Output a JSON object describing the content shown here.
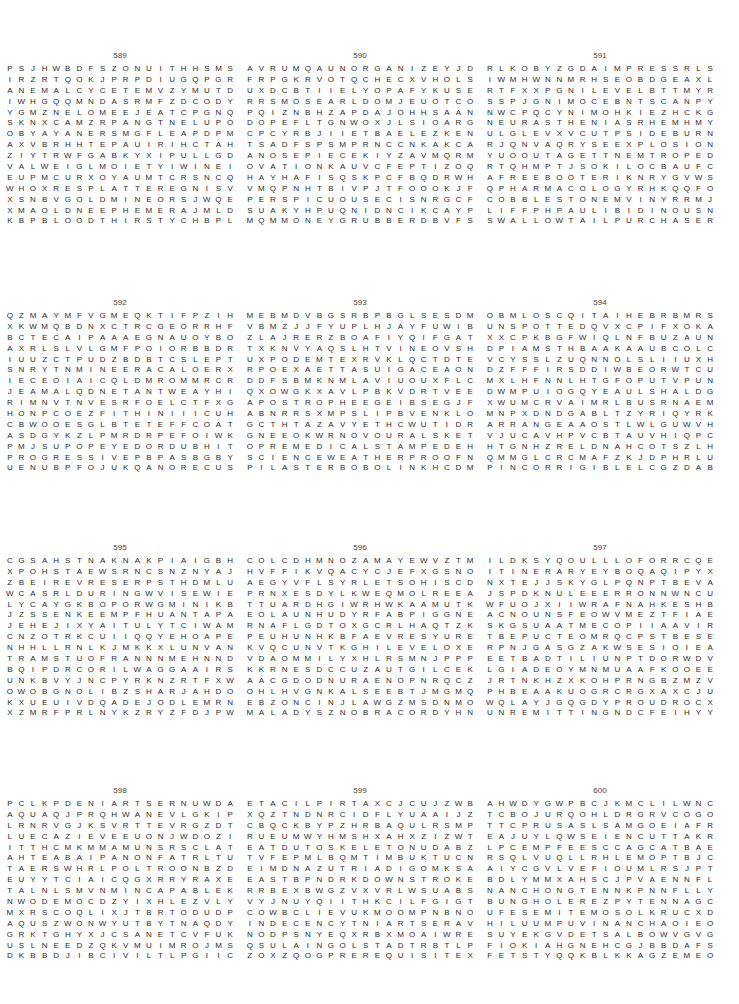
{
  "document": {
    "type": "word-search-solutions",
    "puzzles": [
      {
        "number": "589",
        "rows": [
          "PSJHWBDFSZONUITHHSMS",
          "IRZRTQOKJPRPDIUGQPGR",
          "ANEMALCYCETEMVZYMUTD",
          "IWHGQQMNDASRMFZDCODY",
          "YGMZNELOMEEJEATCPGNQ",
          "SKNXCAMZRPANGTNELUPO",
          "OBYAYANERSMGFLEAPDPM",
          "AXVBRHHTEPAUIRIHCTAH",
          "ZIYTRWFGABKYXIPULLGD",
          "VALWEIGLMOIETYIWINEI",
          "EUPMCURXOYAUMTCRSNCQ",
          "WHOXRESPLATTEREGNISV",
          "XSNBVGOLDMINEORSJWQE",
          "XMAOLDNEEPHEMERAJMLD",
          "KBPBLOODTHIRSTYCHBPL"
        ],
        "found_words": [
          "CYCLAMEN",
          "MOIETY",
          "SPLATTER",
          "SINGER",
          "GOLDMINE",
          "EPHEMERA",
          "BLOODTHIRSTY",
          "OPULENT",
          "PULLED",
          "EUPHONIUM"
        ]
      },
      {
        "number": "590",
        "rows": [
          "AVRUMQAUNORGANIZEYJD",
          "FRPGKRVOTQCHECXVHOLS",
          "UXDCBTIIELYOPAFYKUSE",
          "RRSMOSEARLDOMJEUOTCO",
          "PQIZNBHZAPDAJOHHSAAN",
          "DOPEFLTGNWOXJLSIOARG",
          "CPCYRBJIIETBAELEZKEN",
          "TSADFSPSMPRNCCNKAKCA",
          "ANOSEPIECEKIYZAVMQRM",
          "OVATIONKAUVCFEPTIZOQ",
          "HAYHAFISQSKPCFBQDRWH",
          "VMQPNHTBIVPJTFOOOKJF",
          "PERSPICUOUSECISNRGCF",
          "SUAKYHPUQNIDNCIKCAYP",
          "MQMMONEYGRUBBERDBVFS"
        ],
        "found_words": [
          "ORGANIZE",
          "EARLDOM",
          "NOSEPIECE",
          "OVATION",
          "PERSPICUOUS",
          "MONEYGRUBBER"
        ]
      },
      {
        "number": "591",
        "rows": [
          "RLKOBYZGDAIMPRESSRLS",
          "IWMHWNNMRHSEOBDGEAXL",
          "RTFXXPGNILEVELBTTMYR",
          "SSPJGNIMOCEBNTSCANPY",
          "NWCPQCYNIMOHKIEZHCKG",
          "NEURASTHENIASRHEMHMY",
          "ULGLEVXVCUTPSIDEBURN",
          "RJQNVAQRYSEEXPLOSION",
          "YUOOUTAGETTNEMTROPED",
          "RTQHMPTJSOKILOCBAUFC",
          "AFREEBOOTERIKNRYGVWS",
          "QPHARMACOLOGYRHKQQFO",
          "COBBLESTONEMVINYRRMJ",
          "LIFFPHPAULIBIDINOUSNI",
          "SWALLOWTAILPURCHASER"
        ],
        "found_words": [
          "IMPRESS",
          "LEVELING",
          "BECOMING",
          "HOMONYMIC",
          "NEURASTHENIA",
          "SIDEBURN",
          "EXPLOSION",
          "OUTAGE",
          "DEPORTMENT",
          "FREEBOOTER",
          "PHARMACOLOGY",
          "COBBLESTONE",
          "LIBIDINOUS",
          "SWALLOWTAIL",
          "PURCHASER"
        ]
      },
      {
        "number": "592",
        "rows": [
          "QZMAYMFVGMEQKTIFPZIH",
          "XKWMQBDNXCTRCGEORRHF",
          "BCTECAIPAAAEGNAUOYBO",
          "AXRLSLVLGMFPOIORBBDR",
          "IUUZCTPUDZBDBTCSLEPT",
          "SNRYTNMINEERACALOERXH",
          "IECEOIAICQLDMROMMRCR",
          "JEAMALQDNETANTWEAYHI",
          "RIMNVTNVESRFOELCTFXG",
          "HONPCOEZFITHINIIICUH",
          "CBWOOESGLBTETEFFCOAT",
          "ASDGYKZLPMRDRPEFOIWK",
          "PMJSUPOPEYEDORDUBHIT",
          "PROGRESSIVEPBPASBGBY",
          "UENUBPFOJUKQANORECUS"
        ],
        "found_words": [
          "POPEYED",
          "PROGRESSIVE",
          "FORTHRIGHT",
          "PROBLEM"
        ]
      },
      {
        "number": "593",
        "rows": [
          "MEBMDVBGSRBPBGLSESDM",
          "VBMZJJFYUPLHJAYFUWIB",
          "ZLAJRERZBOAFIYQIFGAT",
          "TXKNVYAQSLHTVINEOVSH",
          "UXPODEMTEXRVKLQCTDTE",
          "RPOEXAETTASUIGACEAON",
          "DDFSBMKNMLAVIUOUXFLC",
          "QXOWGKXAVLPBKVDRTVEE",
          "APOSTROPHEEGEIBSEGJF",
          "ABNRRSXMPSLIPBVENKLO",
          "GCTHTAZAVYETHCWUTIDR",
          "GNEEOKWRNOVOURALSKET",
          "OPREMEDICALSTAMPEDEH",
          "SCIENCEWEATHERPROOFN",
          "PILASTERBOBOLINKHCDM"
        ],
        "found_words": [
          "APOSTROPHE",
          "NOVOURALSK",
          "PREMEDICAL",
          "STAMPEDE",
          "SCIENCE",
          "WEATHERPROOF",
          "PILASTER",
          "BOBOLINK",
          "FORTHE"
        ]
      },
      {
        "number": "594",
        "rows": [
          "OBMLOSCQITAIHEBRBMRS",
          "UNSPOTTEDQVXCPIFXOKA",
          "XXCPKBGFWIQLNFBUZAUN",
          "DPIAMSTHBAAKAAUBCOLC",
          "VCYSSLZUQNNOLSLIIUXH",
          "DZFFFIRSDDIWBEORWTCU",
          "MXLHFNNLHTGFOPUTVPUN",
          "DWMPUIOGQYEAULSHALDG",
          "XWUMCRVAIMRLBUSRNAEM",
          "MNPXDNDGABLTZYRIQYRK",
          "ARRANGEAAOSTLWLGUWVH",
          "VJUCAVHPVCBTAUVHIQPC",
          "HTGNHZRELDNAHCOTSZLH",
          "QMMGLCRCMAFZKJDPHRLU",
          "PINCORRIGIBLELCGZDAB"
        ],
        "found_words": [
          "QITAIHE",
          "UNSPOTTED",
          "ARRANGE",
          "RELDNAHC",
          "INCORRIGIBLE",
          "SANCHUNG"
        ]
      },
      {
        "number": "595",
        "rows": [
          "CGSAHSTNAKNAKPIAIGBH",
          "XPOHSTAEWSRNCSNZNYAJ",
          "ZBEIREVRESERPSTHDMLU",
          "WCASRLDURINGWVISEWIE",
          "LYCAYGKBOPORWGMINIKB",
          "JZSSENKEEMPFHUANTAPA",
          "JEHEJIXYAITULYTCIWAM",
          "CNZOTRKCUIIQQYEHOAPE",
          "NHHLLRNLKJMKKXLUNVAN",
          "TRAMSTUOFRANNNMEHNND",
          "BQIPDRCORILWAGGAAIRS",
          "UNKBVYJNCPYRKNZRTFXW",
          "OWOBGNOLIBZSHARJAHDO",
          "KXUEUIVDQADEJODLEMRN",
          "XZMRFPRLNYKZRYZFDJPW"
        ],
        "found_words": [
          "NAKNAK",
          "SWEATSHOP",
          "PRESERVER",
          "DURING",
          "MEEKNESS",
          "TRAMSTUO",
          "WOBGNOL",
          "SHARJAH",
          "BALKAN"
        ]
      },
      {
        "number": "596",
        "rows": [
          "COLCDHMNOZAMAYEWVZTM",
          "HVFFIKVQACYCJEFXGSNO",
          "AEGYVFLSYRLETSOHISCD",
          "PRNXESDYLKWEQMOLREEA",
          "TTUARDHGIWRHWKAAMUTK",
          "EOLAUNHUDYRFABPIGGNE",
          "RNAFLGDTOXGCRLHAQTZK",
          "PEUHUNHKBFAEVRESYURE",
          "KVQCUNVTKGHILEVELOXE",
          "VDAOMMILYXHLRSMNJPPP",
          "KKRNESDCCUZAUTGILCEK",
          "AACGDODNURAENOPNRQCZ",
          "OHLHVGNKALSEEBTJMGMQ",
          "EBZONCINJLAWGZMSDNMO",
          "MALADYSZNOBRACORDYHN"
        ],
        "found_words": [
          "AMAZON",
          "YRLETSOH",
          "EVRES",
          "LEVEL",
          "ENOPNRQC",
          "MALADY",
          "NOBRACORDYH",
          "CHAPTER"
        ]
      },
      {
        "number": "597",
        "rows": [
          "ILDKSYQOULLLOFORRCQE",
          "ITINERARYEYBOQAQIPYX",
          "NXTEJJSKYGLPQNPTBEVA",
          "JSPDKNULEEERRONNWNCU",
          "WFUOJXIIWRAFNAHKESHB",
          "ACNOUNSFEOWVMEZTFIAE",
          "SKGSUAATMECOPIIAAVIR",
          "TBEPUCTEOMRQCPSTBESE",
          "RPNJGASGZAKWSESIOIEA",
          "EETBADTILIUNPTDORWDV",
          "LGIADEOYMNMUAAFKOOEE",
          "JRTNKHZXKOHPRNGBZMZV",
          "PHBEAAKUOGRCRGXAXCJU",
          "WQLAYJGQGDYPROUDROCX",
          "UNREMITTINGNDCFEIHYY"
        ],
        "found_words": [
          "ITINERARY",
          "RAFNAHKE",
          "UNREMITTING",
          "WASTREL",
          "BEREAVE"
        ]
      },
      {
        "number": "598",
        "rows": [
          "PCLKPDENIARTSERNUWDA",
          "AQUAQJPRQHWANEVLGKIP",
          "LRNRVGJKSVRTTEVRGZDT",
          "LUECAZIEVEEUONJWDOZI",
          "ITTHCMKMMAMUNSRSCLAT",
          "AHTEABAIPANONFATRLTU",
          "TAERSWHRLPOLTROONBZD",
          "EUYYTCIAICQGXRRYRAXE",
          "TALNLSMVNMINCAPABLEK",
          "NWODEMOCDZYIXHLEZVLY",
          "MXRSCOQLIXJTBRTODUDP",
          "AQUSZWONWYUTBYTNAQDY",
          "GRKTGHYXJCSANETCVFUK",
          "USLNEEDZQKVMUIMROJMS",
          "DKBBDJIBCIVILTLPGIIC"
        ],
        "found_words": [
          "DENIARTSE",
          "UNRESTRAINED",
          "PALLIATE",
          "APTITUDE",
          "POLTROON",
          "INCAPABLE",
          "NWODEMOC",
          "CIVIL",
          "ONFAT"
        ]
      },
      {
        "number": "599",
        "rows": [
          "ETACILPIRTAXCJCUJZWB",
          "XQZTNDNRCIDFLYUAAIJZ",
          "CBQCKBYPZHRBAQULRSMP",
          "RUEUMWYHMSHXAHXZIZWT",
          "EATDUTOSKELETONUDABZ",
          "TVFEPMLBQMTIMBUKTUCN",
          "EIMDNAZUTRIADIGOMKSA",
          "EASTBPNDRKDOWNSTROKE",
          "RRBEXBWGZVXVRLWSUABS",
          "VYJNUYQIITHKCILFGIGT",
          "COWBCLIEVUKMOOMPNBNO",
          "INDECENCYTNIARTSERAV",
          "NODPSNYEQXRBXMOAIWRE",
          "QSULAINGOLSTADTRBTLP",
          "ZOXZQOGPREREQUISITEX"
        ],
        "found_words": [
          "ETACILPIRT",
          "SKELETON",
          "TIMBUKTU",
          "TRIAD",
          "DOWNSTROKE",
          "KCILF",
          "INDECENCY",
          "TNIARTSER",
          "INGOLSTADT",
          "PREREQUISITE",
          "STOVEPIPE"
        ]
      },
      {
        "number": "600",
        "rows": [
          "AHWDYGWPBCJKMCLILWNC",
          "TCBOJURQOHLDRGRVCOGO",
          "TTCPRUSASLSAMGOEIAFR",
          "EAJUYLQWSEIENCUTTAKR",
          "LPCEMPFEESCCAGCATBAE",
          "RSQLVUQLLRHLEMOPTBJC",
          "AIYCGVLVEFIOUMLRSJPT",
          "BDLYMMXAHSCJPVAENNFL",
          "NANCHONGTENNKPNNFLLY",
          "BUNGHOLEREZPYTENNAGC",
          "UFESEMITEMOSOLKRUCXD",
          "HILUUMPUVINANCHAOIEO",
          "SUYEKGVDETSALBOWVGVG",
          "FIOKIAHGNEHCGJBBDAFS",
          "FETSTYQQKBLKKAGZEMEO"
        ],
        "found_words": [
          "NANCHONG",
          "BUNGHOLE",
          "SEMITEMOS",
          "NANCHA",
          "DETSALB",
          "IAHGNEHC",
          "CORRECTLY",
          "TENNAG",
          "ATTELRAB"
        ]
      }
    ]
  }
}
